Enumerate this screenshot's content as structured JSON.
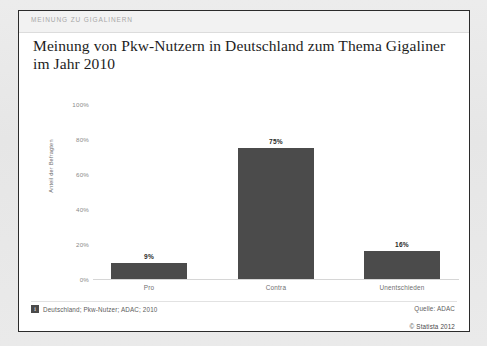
{
  "card": {
    "kicker": "MEINUNG ZU GIGALINERN",
    "title": "Meinung von Pkw-Nutzern in Deutschland zum Thema Gigaliner im Jahr 2010"
  },
  "footer": {
    "info_icon_glyph": "i",
    "footnote": "Deutschland; Pkw-Nutzer; ADAC; 2010",
    "source": "Quelle: ADAC",
    "copyright": "© Statista 2012"
  },
  "colors": {
    "bar": "#4b4b4b",
    "card_border": "#2b2b2b",
    "page_bg": "#e8e8e8",
    "kicker_text": "#a8a8a8",
    "axis_text": "#8a8a8a"
  },
  "chart_data": {
    "type": "bar",
    "title": "Meinung von Pkw-Nutzern in Deutschland zum Thema Gigaliner im Jahr 2010",
    "subtitle": "MEINUNG ZU GIGALINERN",
    "categories": [
      "Pro",
      "Contra",
      "Unentschieden"
    ],
    "values": [
      9,
      75,
      16
    ],
    "value_labels": [
      "9%",
      "75%",
      "16%"
    ],
    "xlabel": "",
    "ylabel": "Anteil der Befragten",
    "ylim": [
      0,
      100
    ],
    "yticks": [
      0,
      20,
      40,
      60,
      80,
      100
    ],
    "ytick_labels": [
      "0%",
      "20%",
      "40%",
      "60%",
      "80%",
      "100%"
    ],
    "grid": false,
    "legend": null,
    "unit": "%",
    "source": "Quelle: ADAC",
    "note": "Deutschland; Pkw-Nutzer; ADAC; 2010",
    "copyright": "© Statista 2012"
  }
}
